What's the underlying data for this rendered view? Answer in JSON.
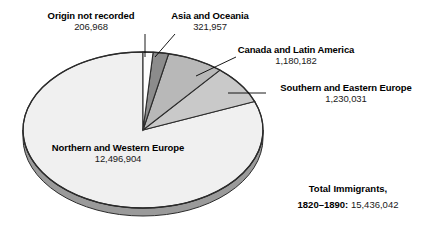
{
  "chart_data": {
    "type": "pie",
    "title": "",
    "total_label": "Total Immigrants,",
    "period_label": "1820–1890:",
    "total_value": "15,436,042",
    "total_value_number": 15436042,
    "categories": [
      "Origin not recorded",
      "Asia and Oceania",
      "Canada and Latin America",
      "Southern and Eastern Europe",
      "Northern and Western Europe"
    ],
    "values": [
      206968,
      321957,
      1180182,
      1230031,
      12496904
    ],
    "value_labels": [
      "206,968",
      "321,957",
      "1,180,182",
      "1,230,031",
      "12,496,904"
    ],
    "colors": [
      "#fdfdfd",
      "#8c8c8c",
      "#b8b8b8",
      "#c9c9c9",
      "#f0f0f0"
    ],
    "legend": "labels-with-leader-lines",
    "grid": false,
    "slices": [
      {
        "name": "Origin not recorded",
        "value": 206968,
        "value_label": "206,968",
        "percent": 1.34,
        "color": "#fdfdfd"
      },
      {
        "name": "Asia and Oceania",
        "value": 321957,
        "value_label": "321,957",
        "percent": 2.09,
        "color": "#8c8c8c"
      },
      {
        "name": "Canada and Latin America",
        "value": 1180182,
        "value_label": "1,180,182",
        "percent": 7.65,
        "color": "#b8b8b8"
      },
      {
        "name": "Southern and Eastern Europe",
        "value": 1230031,
        "value_label": "1,230,031",
        "percent": 7.97,
        "color": "#c9c9c9"
      },
      {
        "name": "Northern and Western Europe",
        "value": 12496904,
        "value_label": "12,496,904",
        "percent": 80.96,
        "color": "#f0f0f0"
      }
    ]
  },
  "labels": {
    "origin_not_recorded": {
      "name": "Origin not recorded",
      "value": "206,968"
    },
    "asia_oceania": {
      "name": "Asia and Oceania",
      "value": "321,957"
    },
    "canada_latin_america": {
      "name": "Canada and Latin America",
      "value": "1,180,182"
    },
    "southern_eastern_europe": {
      "name": "Southern and Eastern Europe",
      "value": "1,230,031"
    },
    "northern_western_europe": {
      "name": "Northern and Western Europe",
      "value": "12,496,904"
    }
  },
  "total": {
    "line1": "Total Immigrants,",
    "years": "1820–1890:",
    "value": "15,436,042"
  }
}
